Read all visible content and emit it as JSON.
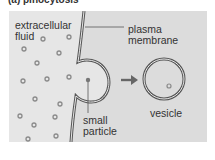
{
  "heading": "(a) pinocytosis",
  "labels": {
    "extracellular_fluid_1": "extracellular",
    "extracellular_fluid_2": "fluid",
    "plasma_membrane_1": "plasma",
    "plasma_membrane_2": "membrane",
    "small_particle_1": "small",
    "small_particle_2": "particle",
    "vesicle": "vesicle"
  },
  "colors": {
    "background": "#e6e6e6",
    "cell_interior": "#dcdcdc",
    "membrane": "#555555",
    "particle": "#8a8a8a",
    "text": "#333333"
  }
}
